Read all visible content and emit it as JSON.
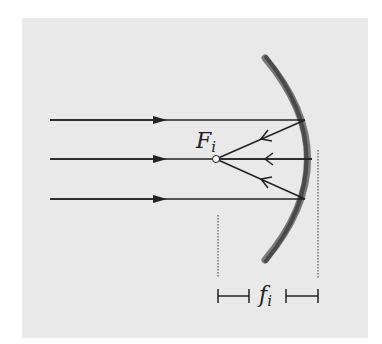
{
  "figure": {
    "type": "concave-mirror-focus-diagram",
    "background_color": "#e9e9e9",
    "mirror_color": "#555555",
    "ray_color": "#222222",
    "labels": {
      "focal_point_main": "F",
      "focal_point_sub": "i",
      "focal_length_main": "f",
      "focal_length_sub": "i"
    },
    "incident_rays": [
      {
        "y": 120,
        "direction": "right"
      },
      {
        "y": 159,
        "direction": "right"
      },
      {
        "y": 199,
        "direction": "right"
      }
    ],
    "reflected_rays": [
      {
        "from": [
          305,
          120
        ],
        "to": [
          216,
          159
        ]
      },
      {
        "from": [
          312,
          159
        ],
        "to": [
          216,
          159
        ]
      },
      {
        "from": [
          305,
          199
        ],
        "to": [
          216,
          159
        ]
      }
    ],
    "focal_point": [
      216,
      159
    ],
    "dimension": {
      "left_x": 218,
      "right_x": 318,
      "bar_y": 296
    }
  }
}
